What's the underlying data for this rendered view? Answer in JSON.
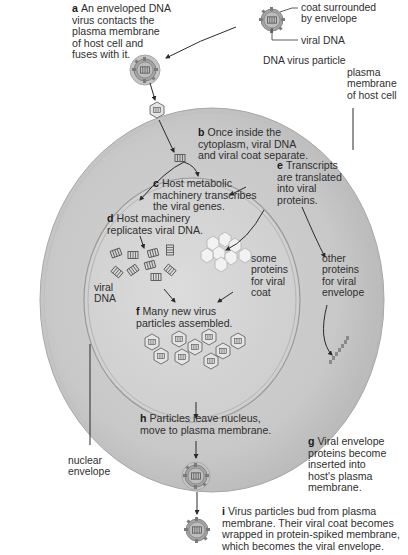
{
  "figure": {
    "colors": {
      "background": "#ffffff",
      "cytoplasm": "#c9c9c9",
      "cytoplasm_edge": "#b0b0b0",
      "nucleus": "#d6d6d6",
      "membrane_line": "#8f8f8f",
      "text": "#2f2f2f",
      "arrow": "#2a2a2a",
      "virus_fill": "#9a9a9a"
    }
  },
  "particle_legend": {
    "coat_label": "coat surrounded\nby envelope",
    "dna_label": "viral DNA",
    "caption": "DNA virus particle"
  },
  "structure_labels": {
    "plasma_membrane": "plasma\nmembrane\nof host cell",
    "nuclear_envelope": "nuclear\nenvelope",
    "viral_dna": "viral\nDNA",
    "coat_proteins": "some\nproteins\nfor viral\ncoat",
    "envelope_proteins": "other\nproteins\nfor viral\nenvelope"
  },
  "steps": [
    {
      "letter": "a",
      "text": "An enveloped DNA\nvirus contacts the\nplasma membrane\nof host cell and\nfuses with it."
    },
    {
      "letter": "b",
      "text": "Once inside the\ncytoplasm, viral DNA\nand viral coat separate."
    },
    {
      "letter": "c",
      "text": "Host metabolic\nmachinery transcribes\nthe viral genes."
    },
    {
      "letter": "d",
      "text": "Host machinery\nreplicates viral DNA."
    },
    {
      "letter": "e",
      "text": "Transcripts\nare translated\ninto viral\nproteins."
    },
    {
      "letter": "f",
      "text": "Many new virus\nparticles assembled."
    },
    {
      "letter": "g",
      "text": "Viral envelope\nproteins become\ninserted into\nhost's plasma\nmembrane."
    },
    {
      "letter": "h",
      "text": "Particles leave nucleus,\nmove to plasma membrane."
    },
    {
      "letter": "i",
      "text": "Virus particles bud from plasma\nmembrane. Their viral coat becomes\nwrapped in protein-spiked membrane,\nwhich becomes the viral envelope."
    }
  ]
}
